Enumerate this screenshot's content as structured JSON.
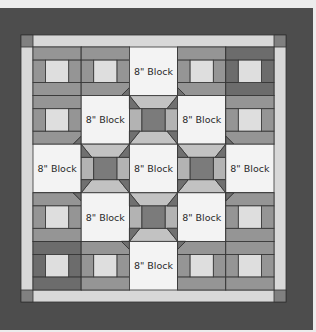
{
  "diagram": {
    "type": "quilt-layout",
    "grid": {
      "rows": 5,
      "cols": 5
    },
    "block_label": "8\" Block",
    "layout": [
      [
        "rail",
        "rail",
        "plain",
        "rail",
        "rail-dark"
      ],
      [
        "rail",
        "plain",
        "snowball",
        "plain",
        "rail"
      ],
      [
        "plain",
        "snowball",
        "plain",
        "snowball",
        "plain"
      ],
      [
        "rail",
        "plain",
        "snowball",
        "plain",
        "rail"
      ],
      [
        "rail-dark",
        "rail",
        "plain",
        "rail",
        "rail"
      ]
    ],
    "labels": [
      {
        "row": 0,
        "col": 2,
        "text": "8\" Block"
      },
      {
        "row": 1,
        "col": 1,
        "text": "8\" Block"
      },
      {
        "row": 1,
        "col": 3,
        "text": "8\" Block"
      },
      {
        "row": 2,
        "col": 0,
        "text": "8\" Block"
      },
      {
        "row": 2,
        "col": 2,
        "text": "8\" Block"
      },
      {
        "row": 2,
        "col": 4,
        "text": "8\" Block"
      },
      {
        "row": 3,
        "col": 1,
        "text": "8\" Block"
      },
      {
        "row": 3,
        "col": 3,
        "text": "8\" Block"
      },
      {
        "row": 4,
        "col": 2,
        "text": "8\" Block"
      }
    ],
    "colors": {
      "background": "#ececec",
      "outer_border": "#4d4d4d",
      "inner_border": "#d8d8d8",
      "corner_square": "#808080",
      "plain_block": "#f3f3f3",
      "rail": "#959595",
      "rail_dark": "#6c6c6c",
      "rail_center": "#dedede",
      "snowball_center": "#7b7b7b",
      "snowball_side": "#b3b3b3",
      "snowball_trap": "#c2c2c2",
      "snowball_corner": "#707070",
      "line": "#333333"
    }
  }
}
